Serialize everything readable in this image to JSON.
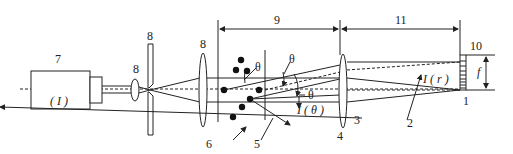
{
  "diagram": {
    "labels": {
      "laser": "7",
      "laser_symbol": "( I )",
      "pinhole": "8",
      "small_lens": "8",
      "collimating_lens": "8",
      "measurement_zone": "9",
      "fourier_lens_distance": "11",
      "detector": "10",
      "focal_length": "f",
      "center_detector": "1",
      "scattered_light": "2",
      "unscattered_beam": "3",
      "fourier_lens": "4",
      "scattered_ray": "5",
      "particles": "6",
      "theta_1": "θ",
      "theta_2": "θ",
      "theta_3": "θ",
      "intensity_theta": "I ( θ )",
      "intensity_r": "I ( r )"
    },
    "colors": {
      "line": "#222222",
      "background": "#ffffff"
    }
  }
}
